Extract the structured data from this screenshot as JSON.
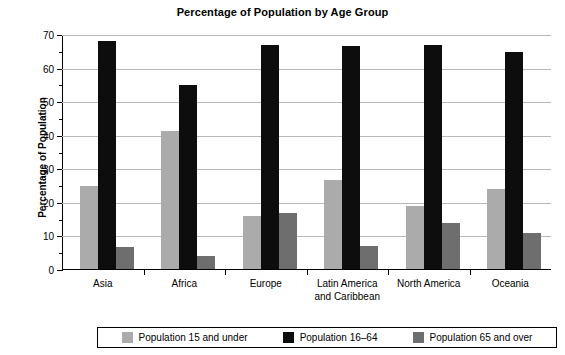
{
  "chart_data": {
    "type": "bar",
    "title": "Percentage of Population by Age Group",
    "xlabel": "",
    "ylabel": "Percentage of Population",
    "categories": [
      "Asia",
      "Africa",
      "Europe",
      "Latin America\nand Caribbean",
      "North America",
      "Oceania"
    ],
    "series": [
      {
        "name": "Population 15 and under",
        "color": "#ababab",
        "values": [
          24.8,
          41.0,
          15.7,
          26.6,
          18.8,
          23.7
        ]
      },
      {
        "name": "Population 16–64",
        "color": "#0d0d0d",
        "values": [
          68.0,
          54.8,
          66.6,
          66.5,
          66.6,
          64.5
        ]
      },
      {
        "name": "Population 65 and over",
        "color": "#6e6e6e",
        "values": [
          6.7,
          3.9,
          16.8,
          6.8,
          13.7,
          10.8
        ]
      }
    ],
    "ylim": [
      0,
      70
    ],
    "yticks": [
      0,
      10,
      20,
      30,
      40,
      50,
      60,
      70
    ],
    "ytick_labels": [
      "0",
      "10",
      "20",
      "30",
      "40",
      "50",
      "60",
      "70"
    ],
    "yminor_ticks": [
      5,
      15,
      25,
      35,
      45,
      55,
      65
    ],
    "grid": "horizontal",
    "legend_position": "bottom"
  },
  "legend": {
    "items": [
      {
        "label": "Population 15 and under",
        "color": "#ababab"
      },
      {
        "label": "Population 16–64",
        "color": "#0d0d0d"
      },
      {
        "label": "Population 65 and over",
        "color": "#6e6e6e"
      }
    ]
  }
}
